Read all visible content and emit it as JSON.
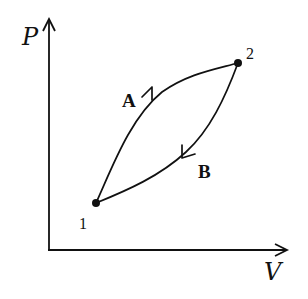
{
  "diagram": {
    "type": "PV diagram - thermodynamic cycle",
    "axes": {
      "y_label": "P",
      "x_label": "V"
    },
    "points": [
      {
        "id": "1",
        "label": "1"
      },
      {
        "id": "2",
        "label": "2"
      }
    ],
    "paths": [
      {
        "id": "A",
        "label": "A",
        "from": "1",
        "to": "2",
        "direction": "1 to 2 (upper curve)"
      },
      {
        "id": "B",
        "label": "B",
        "from": "2",
        "to": "1",
        "direction": "2 to 1 (lower curve)"
      }
    ],
    "colors": {
      "ink": "#111111",
      "background": "#ffffff"
    }
  }
}
